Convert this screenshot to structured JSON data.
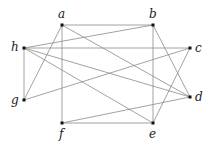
{
  "diagram": {
    "type": "graph",
    "directed": false,
    "nodes": [
      {
        "id": "a",
        "label": "a",
        "x": 62,
        "y": 25,
        "lx": 58,
        "ly": 18
      },
      {
        "id": "b",
        "label": "b",
        "x": 153,
        "y": 25,
        "lx": 149,
        "ly": 18
      },
      {
        "id": "c",
        "label": "c",
        "x": 190,
        "y": 48,
        "lx": 195,
        "ly": 52
      },
      {
        "id": "d",
        "label": "d",
        "x": 190,
        "y": 97,
        "lx": 195,
        "ly": 101
      },
      {
        "id": "e",
        "label": "e",
        "x": 153,
        "y": 123,
        "lx": 149,
        "ly": 138
      },
      {
        "id": "f",
        "label": "f",
        "x": 62,
        "y": 123,
        "lx": 59,
        "ly": 138
      },
      {
        "id": "g",
        "label": "g",
        "x": 24,
        "y": 100,
        "lx": 11,
        "ly": 104
      },
      {
        "id": "h",
        "label": "h",
        "x": 24,
        "y": 48,
        "lx": 11,
        "ly": 51
      }
    ],
    "edges": [
      [
        "a",
        "b"
      ],
      [
        "a",
        "f"
      ],
      [
        "a",
        "g"
      ],
      [
        "a",
        "d"
      ],
      [
        "b",
        "h"
      ],
      [
        "b",
        "e"
      ],
      [
        "b",
        "d"
      ],
      [
        "h",
        "c"
      ],
      [
        "h",
        "g"
      ],
      [
        "h",
        "d"
      ],
      [
        "h",
        "e"
      ],
      [
        "c",
        "g"
      ],
      [
        "c",
        "e"
      ],
      [
        "f",
        "e"
      ],
      [
        "f",
        "d"
      ]
    ],
    "colors": {
      "edge": "#8a8a8a",
      "node": "#111111",
      "label": "#222222"
    }
  }
}
